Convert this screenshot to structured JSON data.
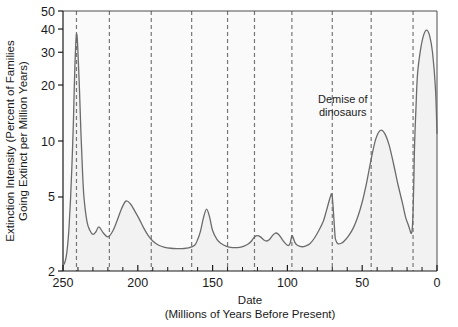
{
  "chart_data": {
    "type": "line",
    "title": "",
    "xlabel": "Date\n(Millions of Years Before Present)",
    "xlabel_line1": "Date",
    "xlabel_line2": "(Millions of Years Before Present)",
    "ylabel": "Extinction Intensity (Percent of Families Going Extinct per Million Years)",
    "ylabel_line1": "Extinction Intensity (Percent of Families",
    "ylabel_line2": "Going Extinct per Million Years)",
    "yscale": "log",
    "ylim": [
      2,
      50
    ],
    "xlim": [
      250,
      0
    ],
    "x_reversed": true,
    "grid": "vertical-dashed",
    "legend": "none",
    "xticks": [
      250,
      200,
      150,
      100,
      50,
      0
    ],
    "xtick_labels": [
      "250",
      "200",
      "150",
      "100",
      "50",
      "0"
    ],
    "xminor_ticks": [
      240,
      230,
      220,
      210,
      190,
      180,
      170,
      160,
      140,
      130,
      120,
      110,
      90,
      80,
      70,
      60,
      40,
      30,
      20,
      10
    ],
    "yticks": [
      2,
      5,
      10,
      20,
      30,
      40,
      50
    ],
    "ytick_labels": [
      "2",
      "5",
      "10",
      "20",
      "30",
      "40",
      "50"
    ],
    "series_name": "Extinction intensity",
    "line_color": "#6b6b6b",
    "fill_color": "#f2f2f2",
    "vlines": [
      241,
      219,
      191,
      164,
      140,
      122,
      97,
      70,
      44,
      16
    ],
    "annotations": [
      {
        "text_line1": "Demise of",
        "text_line2": "dinosaurs",
        "x": 63,
        "y": 16
      }
    ],
    "x": [
      250,
      249,
      248,
      247,
      246,
      245,
      244,
      243,
      242.5,
      242,
      241.5,
      241,
      240.5,
      240,
      239,
      238,
      237,
      236,
      234,
      232,
      230,
      228,
      226,
      223,
      220,
      217,
      214,
      211,
      208,
      205,
      202,
      199,
      196,
      193,
      190,
      186,
      182,
      178,
      174,
      170,
      166,
      162,
      160,
      158,
      156,
      154,
      152,
      150,
      147,
      144,
      141,
      138,
      135,
      132,
      129,
      126,
      124,
      122,
      120,
      118,
      116,
      114,
      112,
      110,
      108,
      106,
      104,
      102,
      100,
      99,
      98,
      97,
      96,
      95,
      94,
      92,
      90,
      88,
      85,
      82,
      79,
      76,
      74,
      72,
      71,
      70.5,
      70,
      69.5,
      69,
      68.5,
      68,
      67,
      66,
      64,
      62,
      59,
      56,
      53,
      50,
      47,
      44,
      41,
      38,
      35,
      32,
      29,
      26,
      23,
      21,
      19,
      18,
      17.5,
      17,
      16.5,
      16,
      15.5,
      15,
      14,
      13,
      11,
      9,
      7,
      5,
      3,
      1,
      0
    ],
    "y": [
      2.15,
      2.2,
      2.35,
      2.7,
      3.4,
      4.8,
      7.5,
      13.0,
      19.0,
      26.0,
      33.0,
      37.5,
      36.0,
      30.0,
      19.0,
      11.0,
      7.0,
      5.0,
      3.7,
      3.3,
      3.15,
      3.25,
      3.45,
      3.2,
      3.05,
      3.25,
      3.7,
      4.3,
      4.75,
      4.6,
      4.2,
      3.8,
      3.4,
      3.1,
      2.9,
      2.75,
      2.68,
      2.65,
      2.64,
      2.64,
      2.66,
      2.75,
      2.95,
      3.3,
      3.9,
      4.3,
      3.9,
      3.3,
      2.95,
      2.8,
      2.72,
      2.68,
      2.67,
      2.68,
      2.72,
      2.8,
      2.9,
      3.05,
      3.1,
      3.05,
      2.95,
      2.9,
      2.95,
      3.1,
      3.2,
      3.15,
      3.0,
      2.85,
      2.75,
      2.75,
      2.85,
      3.1,
      3.0,
      2.85,
      2.78,
      2.72,
      2.7,
      2.72,
      2.8,
      3.0,
      3.3,
      3.7,
      4.2,
      4.8,
      5.1,
      5.2,
      5.0,
      4.5,
      3.9,
      3.4,
      3.0,
      2.85,
      2.8,
      2.82,
      2.9,
      3.1,
      3.4,
      3.9,
      4.7,
      6.0,
      8.0,
      10.2,
      11.4,
      11.0,
      9.5,
      7.5,
      5.8,
      4.6,
      3.9,
      3.5,
      3.3,
      3.2,
      3.2,
      3.4,
      4.2,
      6.0,
      9.5,
      15.5,
      23.0,
      31.0,
      37.0,
      39.5,
      37.0,
      30.0,
      19.0,
      11.0,
      6.5,
      4.5,
      3.6,
      3.1,
      2.85,
      2.75,
      2.7,
      2.72,
      2.8,
      3.0,
      3.3,
      3.8,
      4.6,
      6.0,
      8.0,
      10.5,
      11.4,
      10.0,
      7.0,
      4.5,
      3.2,
      2.6,
      2.35,
      2.2,
      2.15
    ]
  }
}
